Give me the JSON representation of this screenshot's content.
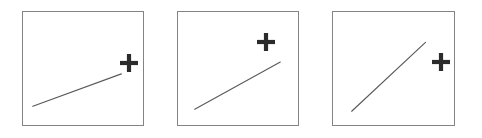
{
  "figure": {
    "title": "",
    "width": 482,
    "height": 138,
    "background_color": "#ffffff",
    "panel_count": 3
  },
  "style": {
    "panel_border_color": "#848484",
    "panel_fill_color": "#ffffff",
    "line_color": "#5a5a5a",
    "cross_color": "#2b2b2b",
    "cross_stroke_width": 4.2,
    "line_stroke_width": 1.15
  },
  "panels": [
    {
      "name": "panel-1",
      "label": "",
      "box": {
        "x": 22,
        "y": 11,
        "width": 122,
        "height": 115
      },
      "line": {
        "x1": 33,
        "y1": 108,
        "x2": 123,
        "y2": 75,
        "slope_description": "shallow-rising"
      },
      "cross": {
        "cx": 129,
        "cy": 63,
        "arm_half_length": 9
      }
    },
    {
      "name": "panel-2",
      "label": "",
      "box": {
        "x": 177,
        "y": 11,
        "width": 122,
        "height": 115
      },
      "line": {
        "x1": 195,
        "y1": 111,
        "x2": 282,
        "y2": 63,
        "slope_description": "medium-rising"
      },
      "cross": {
        "cx": 266,
        "cy": 42,
        "arm_half_length": 9
      }
    },
    {
      "name": "panel-3",
      "label": "",
      "box": {
        "x": 332,
        "y": 11,
        "width": 123,
        "height": 115
      },
      "line": {
        "x1": 352,
        "y1": 113,
        "x2": 427,
        "y2": 43,
        "slope_description": "steep-rising"
      },
      "cross": {
        "cx": 441,
        "cy": 62,
        "arm_half_length": 9
      }
    }
  ],
  "chart_data": {
    "type": "line",
    "title": "",
    "xlabel": "",
    "ylabel": "",
    "grid": false,
    "legend": "none",
    "panels": [
      {
        "name": "panel-1",
        "series": [
          {
            "name": "trend",
            "x": [
              33,
              123
            ],
            "y": [
              108,
              75
            ]
          }
        ],
        "annotations": [
          {
            "type": "cross-marker",
            "x": 129,
            "y": 63
          }
        ]
      },
      {
        "name": "panel-2",
        "series": [
          {
            "name": "trend",
            "x": [
              195,
              282
            ],
            "y": [
              111,
              63
            ]
          }
        ],
        "annotations": [
          {
            "type": "cross-marker",
            "x": 266,
            "y": 42
          }
        ]
      },
      {
        "name": "panel-3",
        "series": [
          {
            "name": "trend",
            "x": [
              352,
              427
            ],
            "y": [
              113,
              43
            ]
          }
        ],
        "annotations": [
          {
            "type": "cross-marker",
            "x": 441,
            "y": 62
          }
        ]
      }
    ]
  }
}
